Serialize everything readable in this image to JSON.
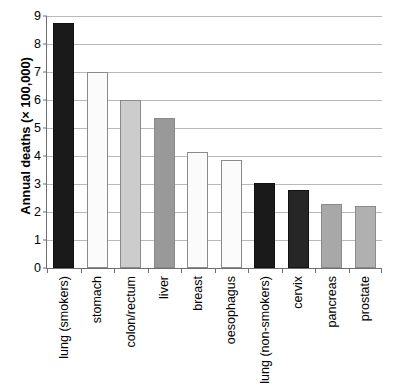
{
  "chart_data": {
    "type": "bar",
    "title": "",
    "xlabel": "",
    "ylabel": "Annual deaths (× 100,000)",
    "ylim": [
      0,
      9
    ],
    "yticks": [
      "0",
      "1",
      "2",
      "3",
      "4",
      "5",
      "6",
      "7",
      "8",
      "9"
    ],
    "grid": true,
    "legend": "none",
    "categories": [
      "lung (smokers)",
      "stomach",
      "colon/rectum",
      "liver",
      "breast",
      "oesophagus",
      "lung (non-smokers)",
      "cervix",
      "pancreas",
      "prostate"
    ],
    "values": [
      8.75,
      7.0,
      6.0,
      5.35,
      4.15,
      3.85,
      3.05,
      2.8,
      2.3,
      2.2
    ],
    "bar_colors": [
      "#1a1a1a",
      "#fbfbfb",
      "#cccccc",
      "#999999",
      "#fbfbfb",
      "#fbfbfb",
      "#1a1a1a",
      "#262626",
      "#a8a8a8",
      "#b0b0b0"
    ],
    "colors": {
      "axis": "#6f6f6f",
      "gridline": "#b9b9b9",
      "text": "#000000",
      "background": "#ffffff",
      "bar_outline": "#8a8a8a"
    }
  }
}
